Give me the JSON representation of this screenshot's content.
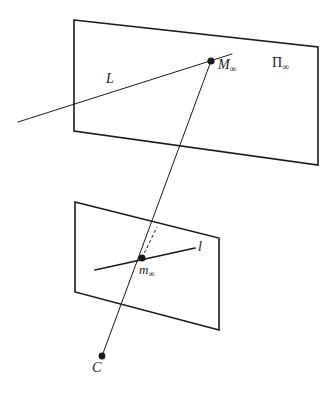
{
  "figure": {
    "background_color": "#ffffff",
    "stroke_color": "#1a1a1a",
    "width": 331,
    "height": 393
  },
  "labels": {
    "point_at_infinity": {
      "base": "M",
      "subscript": "∞"
    },
    "plane_at_infinity": {
      "base": "Π",
      "subscript": "∞"
    },
    "line_L": {
      "base": "L",
      "subscript": ""
    },
    "image_line_l": {
      "base": "l",
      "subscript": ""
    },
    "vanishing_point": {
      "base": "m",
      "subscript": "∞"
    },
    "camera_centre": {
      "base": "C",
      "subscript": ""
    }
  },
  "geometry": {
    "plane_at_infinity": {
      "name": "plane-at-infinity-quad",
      "points": "74,20 318,47 318,165 74,131",
      "stroke_width": 1.6
    },
    "image_plane": {
      "name": "image-plane-quad",
      "points": "75,202 219,238 219,330 75,292",
      "stroke_width": 1.6
    },
    "line_L": {
      "name": "line-L",
      "x1": 18,
      "y1": 122,
      "x2": 232,
      "y2": 54,
      "stroke_width": 1.0
    },
    "image_line_l": {
      "name": "image-line-l",
      "x1": 95,
      "y1": 270,
      "x2": 195,
      "y2": 248,
      "stroke_width": 1.7
    },
    "projection_ray": {
      "name": "projection-ray",
      "x1": 102,
      "y1": 356,
      "x2": 211,
      "y2": 61,
      "stroke_width": 1.0
    },
    "dashed_segment": {
      "name": "dashed-segment",
      "x1": 142,
      "y1": 258,
      "x2": 157,
      "y2": 227,
      "stroke_width": 1.0,
      "dash": "3,2.6"
    },
    "point_M": {
      "name": "point-M-infinity",
      "cx": 211,
      "cy": 61,
      "r": 3.6
    },
    "point_m": {
      "name": "point-m-infinity",
      "cx": 142,
      "cy": 258,
      "r": 3.6
    },
    "point_C": {
      "name": "point-C",
      "cx": 102,
      "cy": 356,
      "r": 3.4
    }
  }
}
